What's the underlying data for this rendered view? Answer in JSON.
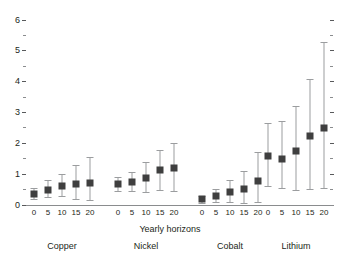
{
  "chart_data": {
    "type": "scatter",
    "title": "",
    "xlabel": "Yearly horizons",
    "ylabel": "",
    "ylim": [
      0,
      6
    ],
    "y_major_ticks": [
      0,
      1,
      2,
      3,
      4,
      5,
      6
    ],
    "y_minor_ticks": [
      0.5,
      1.5,
      2.5,
      3.5,
      4.5,
      5.5
    ],
    "y_tick_labels": [
      "0",
      "1",
      "2",
      "3",
      "4",
      "5",
      "6"
    ],
    "grid": false,
    "legend": "none",
    "marker": "filled-square",
    "error_bars": "vertical-with-caps",
    "categories": [
      "0",
      "5",
      "10",
      "15",
      "20"
    ],
    "groups": [
      {
        "name": "Copper",
        "x_tick_labels": [
          "0",
          "5",
          "10",
          "15",
          "20"
        ],
        "points": [
          {
            "x": "0",
            "value": 0.35,
            "low": 0.18,
            "high": 0.55
          },
          {
            "x": "5",
            "value": 0.5,
            "low": 0.25,
            "high": 0.82
          },
          {
            "x": "10",
            "value": 0.62,
            "low": 0.28,
            "high": 1.0
          },
          {
            "x": "15",
            "value": 0.68,
            "low": 0.2,
            "high": 1.3
          },
          {
            "x": "20",
            "value": 0.72,
            "low": 0.15,
            "high": 1.55
          }
        ]
      },
      {
        "name": "Nickel",
        "x_tick_labels": [
          "0",
          "5",
          "10",
          "15",
          "20"
        ],
        "points": [
          {
            "x": "0",
            "value": 0.68,
            "low": 0.45,
            "high": 0.92
          },
          {
            "x": "5",
            "value": 0.75,
            "low": 0.45,
            "high": 1.08
          },
          {
            "x": "10",
            "value": 0.88,
            "low": 0.42,
            "high": 1.38
          },
          {
            "x": "15",
            "value": 1.12,
            "low": 0.48,
            "high": 1.8
          },
          {
            "x": "20",
            "value": 1.2,
            "low": 0.45,
            "high": 2.02
          }
        ]
      },
      {
        "name": "Cobalt",
        "x_tick_labels": [
          "0",
          "5",
          "10",
          "15",
          "20"
        ],
        "points": [
          {
            "x": "0",
            "value": 0.18,
            "low": 0.08,
            "high": 0.3
          },
          {
            "x": "5",
            "value": 0.28,
            "low": 0.1,
            "high": 0.52
          },
          {
            "x": "10",
            "value": 0.42,
            "low": 0.1,
            "high": 0.82
          },
          {
            "x": "15",
            "value": 0.52,
            "low": 0.08,
            "high": 1.1
          },
          {
            "x": "20",
            "value": 0.78,
            "low": 0.1,
            "high": 1.72
          }
        ]
      },
      {
        "name": "Lithium",
        "x_tick_labels": [
          "0",
          "5",
          "10",
          "15",
          "20"
        ],
        "points": [
          {
            "x": "0",
            "value": 1.6,
            "low": 0.62,
            "high": 2.65
          },
          {
            "x": "5",
            "value": 1.5,
            "low": 0.55,
            "high": 2.72
          },
          {
            "x": "10",
            "value": 1.75,
            "low": 0.48,
            "high": 3.2
          },
          {
            "x": "15",
            "value": 2.25,
            "low": 0.52,
            "high": 4.08
          },
          {
            "x": "20",
            "value": 2.5,
            "low": 0.55,
            "high": 5.3
          }
        ]
      }
    ],
    "colors": {
      "marker": "#3f3f3f",
      "error_bar": "#9b9d9f",
      "axis": "#8a8c8e",
      "text": "#231f20",
      "background": "#ffffff"
    }
  }
}
